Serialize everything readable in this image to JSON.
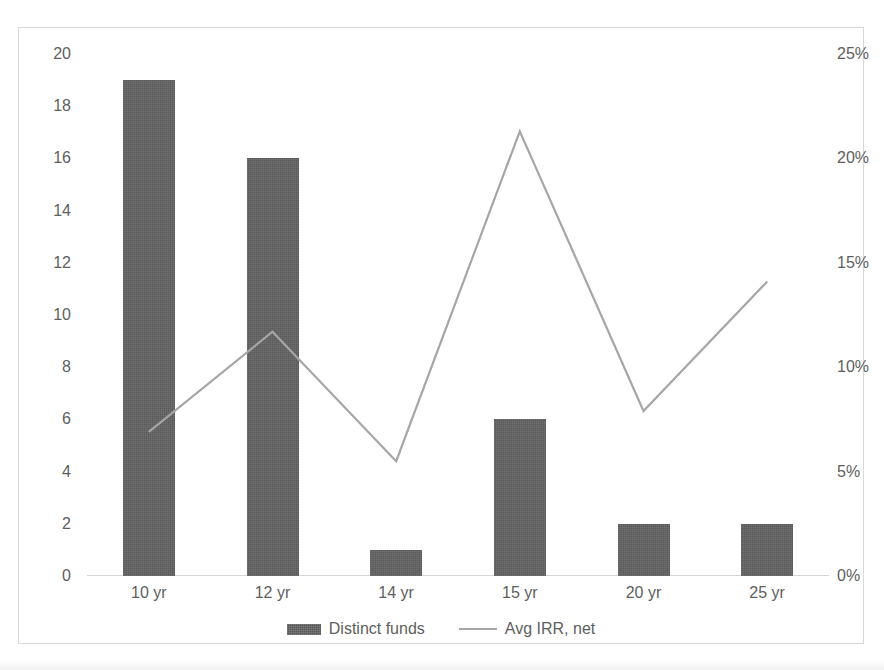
{
  "chart_data": {
    "type": "bar",
    "title": "",
    "subtitle": "",
    "xlabel": "",
    "ylabel": "",
    "categories": [
      "10 yr",
      "12 yr",
      "14 yr",
      "15 yr",
      "20 yr",
      "25 yr"
    ],
    "series": [
      {
        "name": "Distinct funds",
        "type": "bar",
        "axis": "left",
        "color": "#595959",
        "values": [
          19,
          16,
          1,
          6,
          2,
          2
        ]
      },
      {
        "name": "Avg IRR, net",
        "type": "line",
        "axis": "right",
        "color": "#a6a6a6",
        "values": [
          0.069,
          0.117,
          0.055,
          0.213,
          0.079,
          0.141
        ],
        "value_labels": [
          "6.9%",
          "11.7%",
          "5.5%",
          "21.3%",
          "7.9%",
          "14.1%"
        ]
      }
    ],
    "left_axis": {
      "label": "",
      "min": 0,
      "max": 20,
      "step": 2,
      "ticks": [
        "0",
        "2",
        "4",
        "6",
        "8",
        "10",
        "12",
        "14",
        "16",
        "18",
        "20"
      ],
      "tick_values": [
        0,
        2,
        4,
        6,
        8,
        10,
        12,
        14,
        16,
        18,
        20
      ]
    },
    "right_axis": {
      "label": "",
      "min": 0,
      "max": 0.25,
      "step": 0.05,
      "ticks": [
        "0%",
        "5%",
        "10%",
        "15%",
        "20%",
        "25%"
      ],
      "tick_values": [
        0,
        0.05,
        0.1,
        0.15,
        0.2,
        0.25
      ]
    },
    "grid": false,
    "legend_position": "bottom",
    "legend": [
      "Distinct funds",
      "Avg IRR, net"
    ]
  },
  "legend": {
    "items": [
      {
        "label": "Distinct funds",
        "marker": "bar-swatch-icon"
      },
      {
        "label": "Avg IRR, net",
        "marker": "line-swatch-icon"
      }
    ]
  },
  "colors": {
    "bar": "#595959",
    "line": "#a6a6a6",
    "axis_text": "#5e5e5e",
    "frame": "#d8d8d8",
    "baseline": "#d6d6d6",
    "background": "#ffffff"
  }
}
